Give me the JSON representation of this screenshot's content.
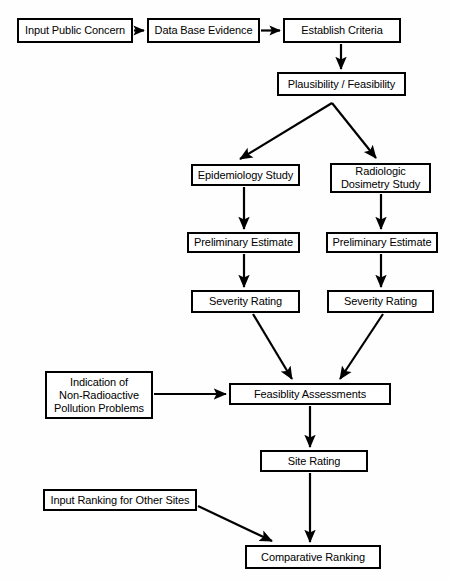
{
  "diagram": {
    "type": "flowchart",
    "orientation": "top-to-bottom",
    "background_color": "#fefefe",
    "line_color": "#000000",
    "box_fill_color": "#ffffff",
    "nodes": [
      {
        "id": "input_public_concern",
        "label": "Input Public Concern",
        "x": 17,
        "y": 18,
        "w": 116,
        "h": 25
      },
      {
        "id": "data_base_evidence",
        "label": "Data Base Evidence",
        "x": 147,
        "y": 18,
        "w": 113,
        "h": 25
      },
      {
        "id": "establish_criteria",
        "label": "Establish Criteria",
        "x": 283,
        "y": 18,
        "w": 118,
        "h": 25
      },
      {
        "id": "plausibility",
        "label": "Plausibility / Feasibility",
        "x": 277,
        "y": 72,
        "w": 129,
        "h": 24
      },
      {
        "id": "epidemiology_study",
        "label": "Epidemiology Study",
        "x": 191,
        "y": 164,
        "w": 109,
        "h": 22
      },
      {
        "id": "radiologic_study",
        "label": "Radiologic\nDosimetry Study",
        "x": 330,
        "y": 163,
        "w": 101,
        "h": 30
      },
      {
        "id": "prelim_estimate_left",
        "label": "Preliminary Estimate",
        "x": 187,
        "y": 232,
        "w": 113,
        "h": 21
      },
      {
        "id": "prelim_estimate_right",
        "label": "Preliminary Estimate",
        "x": 326,
        "y": 232,
        "w": 112,
        "h": 21
      },
      {
        "id": "severity_rating_left",
        "label": "Severity Rating",
        "x": 191,
        "y": 290,
        "w": 109,
        "h": 23
      },
      {
        "id": "severity_rating_right",
        "label": "Severity Rating",
        "x": 327,
        "y": 290,
        "w": 107,
        "h": 23
      },
      {
        "id": "indication_nonradio",
        "label": "Indication of\nNon-Radioactive\nPollution Problems",
        "x": 45,
        "y": 371,
        "w": 108,
        "h": 48
      },
      {
        "id": "feasibility_assess",
        "label": "Feasiblity Assessments",
        "x": 229,
        "y": 383,
        "w": 162,
        "h": 22
      },
      {
        "id": "site_rating",
        "label": "Site Rating",
        "x": 260,
        "y": 450,
        "w": 108,
        "h": 22
      },
      {
        "id": "input_ranking_other",
        "label": "Input Ranking for Other Sites",
        "x": 43,
        "y": 489,
        "w": 154,
        "h": 22
      },
      {
        "id": "comparative_ranking",
        "label": "Comparative Ranking",
        "x": 245,
        "y": 545,
        "w": 136,
        "h": 24
      }
    ],
    "edges": [
      {
        "from": "input_public_concern",
        "to": "data_base_evidence",
        "style": "straight-horizontal"
      },
      {
        "from": "data_base_evidence",
        "to": "establish_criteria",
        "style": "straight-horizontal"
      },
      {
        "from": "establish_criteria",
        "to": "plausibility",
        "style": "straight-vertical"
      },
      {
        "from": "plausibility",
        "to": "epidemiology_study",
        "style": "diagonal-branch-left"
      },
      {
        "from": "plausibility",
        "to": "radiologic_study",
        "style": "diagonal-branch-right"
      },
      {
        "from": "epidemiology_study",
        "to": "prelim_estimate_left",
        "style": "straight-vertical"
      },
      {
        "from": "radiologic_study",
        "to": "prelim_estimate_right",
        "style": "straight-vertical"
      },
      {
        "from": "prelim_estimate_left",
        "to": "severity_rating_left",
        "style": "straight-vertical"
      },
      {
        "from": "prelim_estimate_right",
        "to": "severity_rating_right",
        "style": "straight-vertical"
      },
      {
        "from": "severity_rating_left",
        "to": "feasibility_assess",
        "style": "diagonal-converge"
      },
      {
        "from": "severity_rating_right",
        "to": "feasibility_assess",
        "style": "diagonal-converge"
      },
      {
        "from": "indication_nonradio",
        "to": "feasibility_assess",
        "style": "straight-horizontal"
      },
      {
        "from": "feasibility_assess",
        "to": "site_rating",
        "style": "straight-vertical"
      },
      {
        "from": "site_rating",
        "to": "comparative_ranking",
        "style": "straight-vertical"
      },
      {
        "from": "input_ranking_other",
        "to": "comparative_ranking",
        "style": "diagonal-converge"
      }
    ]
  }
}
